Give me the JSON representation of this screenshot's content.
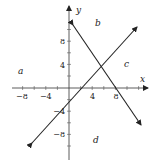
{
  "figure": {
    "axes": {
      "x_label": "x",
      "y_label": "y",
      "x_ticks": [
        {
          "value": -8,
          "label": "−8"
        },
        {
          "value": -4,
          "label": "−4"
        },
        {
          "value": 4,
          "label": "4"
        },
        {
          "value": 8,
          "label": "8"
        }
      ],
      "y_ticks": [
        {
          "value": 8,
          "label": "8"
        },
        {
          "value": 4,
          "label": "4"
        },
        {
          "value": -4,
          "label": "−4"
        },
        {
          "value": -8,
          "label": "−8"
        }
      ]
    },
    "lines": [
      {
        "name": "rising-line",
        "x_intercept": 2.5,
        "y_intercept": -2.7,
        "slope": 1.1
      },
      {
        "name": "falling-line",
        "x_intercept": 8,
        "y_intercept": 12,
        "slope": -1.5
      }
    ],
    "regions": {
      "a": "a",
      "b": "b",
      "c": "c",
      "d": "d"
    },
    "colors": {
      "axis": "#333333",
      "line": "#222222",
      "text": "#222222"
    }
  }
}
